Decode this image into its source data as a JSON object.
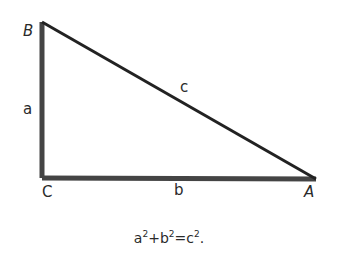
{
  "diagram": {
    "type": "right-triangle",
    "vertices": {
      "B": {
        "label": "B",
        "x": 42,
        "y": 22
      },
      "C": {
        "label": "C",
        "x": 42,
        "y": 178
      },
      "A": {
        "label": "A",
        "x": 316,
        "y": 179
      }
    },
    "sides": {
      "a": {
        "label": "a",
        "from": "B",
        "to": "C"
      },
      "b": {
        "label": "b",
        "from": "C",
        "to": "A"
      },
      "c": {
        "label": "c",
        "from": "B",
        "to": "A"
      }
    },
    "colors": {
      "line": "#333333",
      "text": "#2a2a2a"
    }
  },
  "equation": {
    "a": "a",
    "a_exp": "2",
    "plus": "+",
    "b": "b",
    "b_exp": "2",
    "eq": "=",
    "c": "c",
    "c_exp": "2",
    "end": "."
  }
}
